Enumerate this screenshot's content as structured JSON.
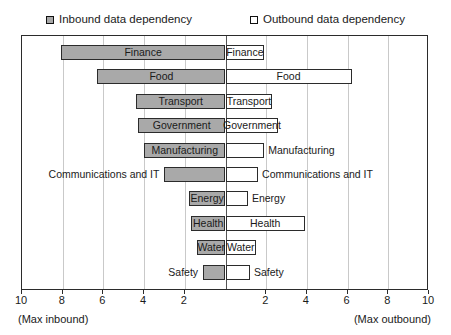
{
  "legend": {
    "inbound": {
      "label": "Inbound data dependency",
      "swatch": "filled-square-icon",
      "color": "#a9a9a9"
    },
    "outbound": {
      "label": "Outbound data dependency",
      "swatch": "hollow-square-icon",
      "color": "#ffffff"
    }
  },
  "axis": {
    "left_caption": "(Max inbound)",
    "right_caption": "(Max outbound)",
    "tick_labels": [
      "10",
      "8",
      "6",
      "4",
      "2",
      "2",
      "4",
      "6",
      "8",
      "10"
    ]
  },
  "chart_data": {
    "type": "bar",
    "orientation": "horizontal-diverging",
    "title": "",
    "xlabel": "",
    "ylabel": "",
    "xlim": [
      -10,
      10
    ],
    "grid": true,
    "legend_position": "top",
    "categories": [
      "Finance",
      "Food",
      "Transport",
      "Government",
      "Manufacturing",
      "Communications and IT",
      "Energy",
      "Health",
      "Water",
      "Safety"
    ],
    "series": [
      {
        "name": "Inbound data dependency",
        "color": "#a9a9a9",
        "values": [
          8.1,
          6.3,
          4.4,
          4.3,
          4.0,
          3.0,
          1.8,
          1.7,
          1.4,
          1.1
        ]
      },
      {
        "name": "Outbound data dependency",
        "color": "#ffffff",
        "values": [
          1.9,
          6.2,
          2.3,
          2.6,
          1.9,
          1.6,
          1.1,
          3.9,
          1.5,
          1.2
        ]
      }
    ],
    "xticks_left": [
      10,
      8,
      6,
      4,
      2
    ],
    "xticks_right": [
      2,
      4,
      6,
      8,
      10
    ],
    "bar_labels": {
      "inbound_label_inside": [
        true,
        true,
        true,
        true,
        true,
        false,
        true,
        true,
        true,
        false
      ],
      "outbound_label_inside": [
        true,
        true,
        true,
        true,
        false,
        false,
        false,
        true,
        true,
        false
      ]
    }
  }
}
